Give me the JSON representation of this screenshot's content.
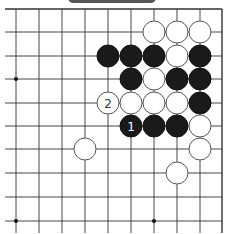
{
  "board": {
    "cols_x": [
      16,
      39,
      62,
      85,
      108,
      131,
      154,
      177,
      200,
      222
    ],
    "rows_y": [
      9,
      32,
      56,
      79,
      103,
      126,
      149,
      173,
      197,
      221
    ],
    "edges": {
      "top": true,
      "right": true,
      "left": false,
      "bottom": false
    },
    "line_color": "#333333",
    "star_points": [
      [
        0,
        3
      ],
      [
        0,
        9
      ],
      [
        6,
        9
      ]
    ],
    "stone_radius": 11
  },
  "stones": [
    {
      "color": "white",
      "col": 6,
      "row": 1
    },
    {
      "color": "white",
      "col": 7,
      "row": 1
    },
    {
      "color": "white",
      "col": 8,
      "row": 1
    },
    {
      "color": "black",
      "col": 4,
      "row": 2
    },
    {
      "color": "black",
      "col": 5,
      "row": 2
    },
    {
      "color": "black",
      "col": 6,
      "row": 2
    },
    {
      "color": "white",
      "col": 7,
      "row": 2
    },
    {
      "color": "black",
      "col": 8,
      "row": 2
    },
    {
      "color": "black",
      "col": 5,
      "row": 3
    },
    {
      "color": "white",
      "col": 6,
      "row": 3
    },
    {
      "color": "black",
      "col": 7,
      "row": 3
    },
    {
      "color": "black",
      "col": 8,
      "row": 3
    },
    {
      "color": "white",
      "col": 4,
      "row": 4,
      "label": "2"
    },
    {
      "color": "white",
      "col": 5,
      "row": 4
    },
    {
      "color": "white",
      "col": 6,
      "row": 4
    },
    {
      "color": "white",
      "col": 7,
      "row": 4
    },
    {
      "color": "black",
      "col": 8,
      "row": 4
    },
    {
      "color": "black",
      "col": 5,
      "row": 5,
      "label": "1"
    },
    {
      "color": "black",
      "col": 6,
      "row": 5
    },
    {
      "color": "black",
      "col": 7,
      "row": 5
    },
    {
      "color": "white",
      "col": 8,
      "row": 5
    },
    {
      "color": "white",
      "col": 3,
      "row": 6
    },
    {
      "color": "white",
      "col": 8,
      "row": 6
    },
    {
      "color": "white",
      "col": 7,
      "row": 7
    }
  ],
  "colors": {
    "black_stone": "#1a1a1a",
    "white_stone": "#ffffff",
    "stone_outline": "#555555",
    "top_tab": "#555555"
  }
}
